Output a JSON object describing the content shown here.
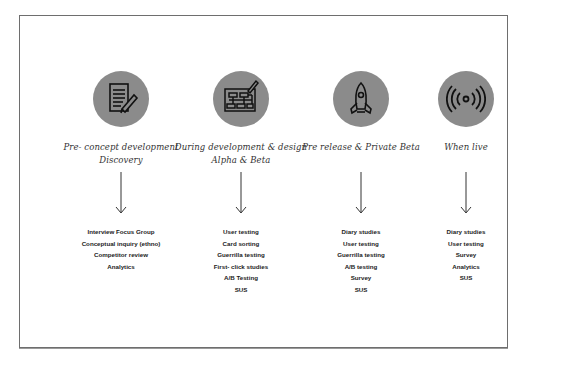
{
  "stages": [
    {
      "icon": "document-pencil-icon",
      "title_lines": [
        "Pre- concept development",
        "Discovery"
      ],
      "methods": [
        "Interview Focus Group",
        "Conceptual inquiry (ethno)",
        "Competitor review",
        "Analytics"
      ]
    },
    {
      "icon": "wireframe-sketch-icon",
      "title_lines": [
        "During development & design",
        "Alpha & Beta"
      ],
      "methods": [
        "User testing",
        "Card sorting",
        "Guerrilla testing",
        "First- click studies",
        "A/B Testing",
        "SUS"
      ]
    },
    {
      "icon": "rocket-icon",
      "title_lines": [
        "Pre release & Private Beta"
      ],
      "methods": [
        "Diary studies",
        "User testing",
        "Guerrilla testing",
        "A/B testing",
        "Survey",
        "SUS"
      ]
    },
    {
      "icon": "broadcast-signal-icon",
      "title_lines": [
        "When live"
      ],
      "methods": [
        "Diary studies",
        "User testing",
        "Survey",
        "Analytics",
        "SUS"
      ]
    }
  ],
  "colors": {
    "circle": "#8b8b8b",
    "border": "#6e6e6e",
    "text": "#222222"
  }
}
